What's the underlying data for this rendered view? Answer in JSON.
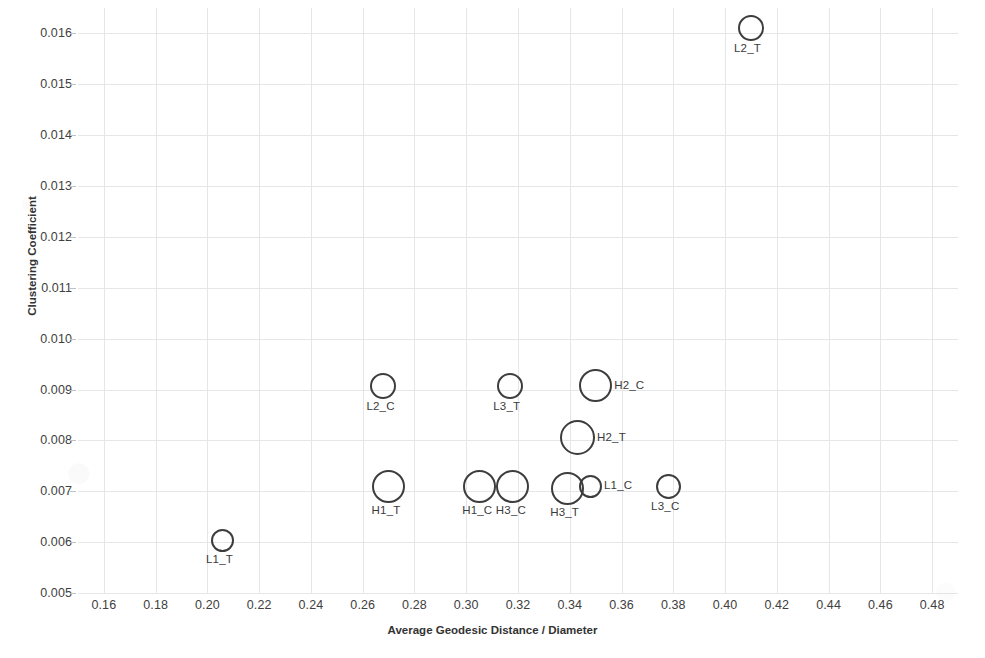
{
  "chart_data": {
    "type": "scatter",
    "title": "",
    "xlabel": "Average Geodesic Distance / Diameter",
    "ylabel": "Clustering Coefficient",
    "xlim": [
      0.15,
      0.49
    ],
    "ylim": [
      0.005,
      0.0165
    ],
    "grid": true,
    "legend": "none",
    "xticks": [
      "0.16",
      "0.18",
      "0.20",
      "0.22",
      "0.24",
      "0.26",
      "0.28",
      "0.30",
      "0.32",
      "0.34",
      "0.36",
      "0.38",
      "0.40",
      "0.42",
      "0.44",
      "0.46",
      "0.48"
    ],
    "xtick_values": [
      0.16,
      0.18,
      0.2,
      0.22,
      0.24,
      0.26,
      0.28,
      0.3,
      0.32,
      0.34,
      0.36,
      0.38,
      0.4,
      0.42,
      0.44,
      0.46,
      0.48
    ],
    "yticks": [
      "0.005",
      "0.006",
      "0.007",
      "0.008",
      "0.009",
      "0.010",
      "0.011",
      "0.012",
      "0.013",
      "0.014",
      "0.015",
      "0.016"
    ],
    "ytick_values": [
      0.005,
      0.006,
      0.007,
      0.008,
      0.009,
      0.01,
      0.011,
      0.012,
      0.013,
      0.014,
      0.015,
      0.016
    ],
    "marker_style": "open-circle",
    "marker_color": "#3d3d3d",
    "points": [
      {
        "label": "L2_T",
        "x": 0.41,
        "y": 0.0161,
        "size": 26,
        "label_pos": "below"
      },
      {
        "label": "L2_C",
        "x": 0.268,
        "y": 0.00907,
        "size": 26,
        "label_pos": "below"
      },
      {
        "label": "L3_T",
        "x": 0.317,
        "y": 0.00907,
        "size": 26,
        "label_pos": "below"
      },
      {
        "label": "H2_C",
        "x": 0.35,
        "y": 0.00907,
        "size": 33,
        "label_pos": "right"
      },
      {
        "label": "H2_T",
        "x": 0.343,
        "y": 0.00805,
        "size": 35,
        "label_pos": "right"
      },
      {
        "label": "H1_T",
        "x": 0.27,
        "y": 0.0071,
        "size": 33,
        "label_pos": "below"
      },
      {
        "label": "H1_C",
        "x": 0.305,
        "y": 0.0071,
        "size": 33,
        "label_pos": "below"
      },
      {
        "label": "H3_C",
        "x": 0.318,
        "y": 0.0071,
        "size": 33,
        "label_pos": "below"
      },
      {
        "label": "H3_T",
        "x": 0.339,
        "y": 0.00706,
        "size": 33,
        "label_pos": "below"
      },
      {
        "label": "L1_C",
        "x": 0.348,
        "y": 0.0071,
        "size": 23,
        "label_pos": "right"
      },
      {
        "label": "L3_C",
        "x": 0.378,
        "y": 0.0071,
        "size": 25,
        "label_pos": "below"
      },
      {
        "label": "L1_T",
        "x": 0.206,
        "y": 0.00603,
        "size": 23,
        "label_pos": "below"
      }
    ]
  }
}
